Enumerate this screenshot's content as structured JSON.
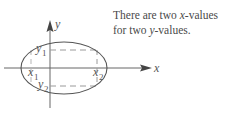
{
  "caption": {
    "line1_prefix": "There are two ",
    "line1_var": "x",
    "line1_suffix": "-values",
    "line2_prefix": "for two ",
    "line2_var": "y",
    "line2_suffix": "-values."
  },
  "axes": {
    "x_label": "x",
    "y_label": "y"
  },
  "points": {
    "x1": {
      "var": "x",
      "sub": "1"
    },
    "x2": {
      "var": "x",
      "sub": "2"
    },
    "y1": {
      "var": "y",
      "sub": "1"
    },
    "y2": {
      "var": "y",
      "sub": "2"
    }
  },
  "colors": {
    "stroke": "#555555",
    "dashed": "#9a9a9a",
    "text": "#4a4a4a"
  }
}
